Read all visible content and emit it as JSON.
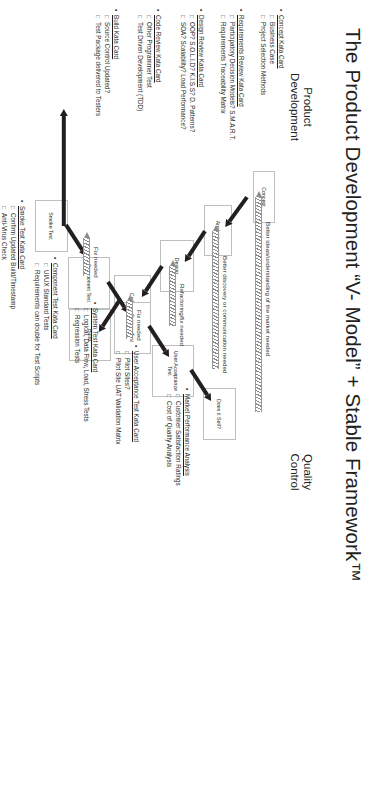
{
  "poster": {
    "title": "The Product Development “V- Model” + Stable Framework™",
    "sections": {
      "left_caption": "Product\nDevelopment",
      "right_caption": "Quality\nControl"
    }
  },
  "flow": {
    "boxes": [
      {
        "id": "concept",
        "label": "Concept"
      },
      {
        "id": "analysis",
        "label": "Analysis"
      },
      {
        "id": "design",
        "label": "Design"
      },
      {
        "id": "coding",
        "label": "Coding"
      },
      {
        "id": "build",
        "label": "Build"
      },
      {
        "id": "smoke",
        "label": "Smoke Test"
      },
      {
        "id": "component",
        "label": "Component Test"
      },
      {
        "id": "system",
        "label": "System Test"
      },
      {
        "id": "uat",
        "label": "User Acceptance Test"
      },
      {
        "id": "sell",
        "label": "Does it Sell?"
      }
    ],
    "feedback_labels": [
      {
        "id": "fb-market",
        "text": "Better ideas/understanding of the market needed"
      },
      {
        "id": "fb-comm",
        "text": "Better discovery or communication needed"
      },
      {
        "id": "fb-refactor",
        "text": "Refactoring/fix needed"
      },
      {
        "id": "fb-fix1",
        "text": "Fix needed"
      },
      {
        "id": "fb-fix2",
        "text": "Fix needed"
      }
    ]
  },
  "kata_cards": [
    {
      "id": "concept-kata",
      "title": "Concept Kata Card",
      "items": [
        "Business Case",
        "Project Selection Methods"
      ]
    },
    {
      "id": "requirements-kata",
      "title": "Requirements Review Kata Card",
      "items": [
        "Participatory Decision Models? S.M.A.R.T.",
        "Requirements Traceability Matrix"
      ]
    },
    {
      "id": "design-kata",
      "title": "Design Review Kata Card",
      "items": [
        "OOP? S.O.L.I.D? K.I.S.S? D. Patterns?",
        "SOA? Scalability? Load Performance?"
      ]
    },
    {
      "id": "code-kata",
      "title": "Code Review Kata Card",
      "items": [
        "Other Programmer Test",
        "Test Driven Development (TDD)"
      ]
    },
    {
      "id": "build-kata",
      "title": "Build Kata Card",
      "items": [
        "Source Control Updated?",
        "Test Package delivered to Testers"
      ]
    },
    {
      "id": "smoke-kata",
      "title": "Smoke Test Kata Card",
      "items": [
        "Confirm Updated Build/Timestamp",
        "Anti-Virus Check"
      ]
    },
    {
      "id": "component-kata",
      "title": "Component Test Kata Card",
      "items": [
        "UI/UX Standard Tests",
        "Requirements can double for Test Scripts"
      ]
    },
    {
      "id": "system-kata",
      "title": "System Test Kata Card",
      "items": [
        "Logical, Data Flow, Load, Stress Tests",
        "Regression Tests"
      ]
    },
    {
      "id": "uat-kata",
      "title": "User Acceptance Test Kata Card",
      "items": [
        "Pilot Sites?",
        "Pilot Site UAT Validation Matrix"
      ]
    },
    {
      "id": "market-kata",
      "title": "Market Performance Analysis",
      "items": [
        "Customer Satisfaction Ratings",
        "Cost of Quality Analysis"
      ]
    }
  ],
  "colors": {
    "text": "#231f20",
    "box_border": "#bfbfbf",
    "arrow": "#231f20",
    "feedback": "#8c8c8c",
    "background": "#ffffff"
  }
}
